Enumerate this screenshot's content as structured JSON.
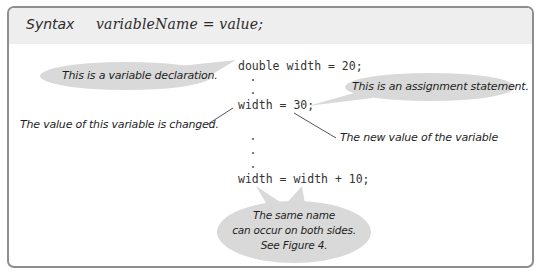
{
  "syntax_box": {
    "header_label": "Syntax",
    "syntax_form": "variableName = value;",
    "code_lines": [
      "double width = 20;",
      "width = 30;",
      "width = width + 10;"
    ],
    "callouts": {
      "declaration": "This is a variable declaration.",
      "assignment": "This is an assignment statement.",
      "changed": "The value of this variable is changed.",
      "new_value": "The new value of the variable",
      "same_name_line1": "The same name",
      "same_name_line2": "can occur on both sides.",
      "same_name_line3": "See Figure 4."
    },
    "colors": {
      "frame_border": "#8e8e8e",
      "header_bg": "#eeeeee",
      "bubble_fill": "#d9d9d9",
      "leader_line": "#555555"
    }
  }
}
